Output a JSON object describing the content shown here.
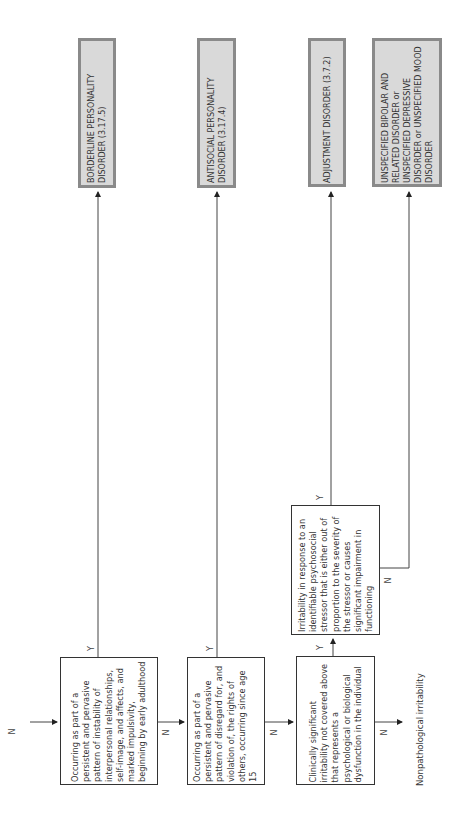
{
  "decisions": [
    {
      "id": "d1",
      "text": "Occurring as part of a persistent and pervasive pattern of instability of interpersonal relationships, self-image, and affects, and marked impulsivity, beginning by early adulthood"
    },
    {
      "id": "d2",
      "text": "Occurring as part of a persistent and pervasive pattern of disregard for, and violation of, the rights of others, occurring since age 15"
    },
    {
      "id": "d3",
      "text": "Clinically significant irritability not covered above that represents a psychological or biological dysfunction in the individual"
    },
    {
      "id": "d4",
      "text": "Irritability in response to an identifiable psychosocial stressor that is either out of proportion to the severity of the stressor or causes significant impairment in functioning"
    }
  ],
  "outcomes": [
    {
      "id": "o1",
      "text": "BORDERLINE PERSONALITY DISORDER (3.17.5)"
    },
    {
      "id": "o2",
      "text": "ANTISOCIAL PERSONALITY DISORDER (3.17.4)"
    },
    {
      "id": "o3",
      "text": "ADJUSTMENT DISORDER (3.7.2)"
    },
    {
      "id": "o4",
      "text": "UNSPECIFIED BIPOLAR AND RELATED DISORDER or UNSPECIFIED DEPRESSIVE DISORDER or UNSPECIFIED MOOD DISORDER"
    }
  ],
  "labels": {
    "yes": "Y",
    "no": "N"
  },
  "terminal": "Nonpathological irritability"
}
